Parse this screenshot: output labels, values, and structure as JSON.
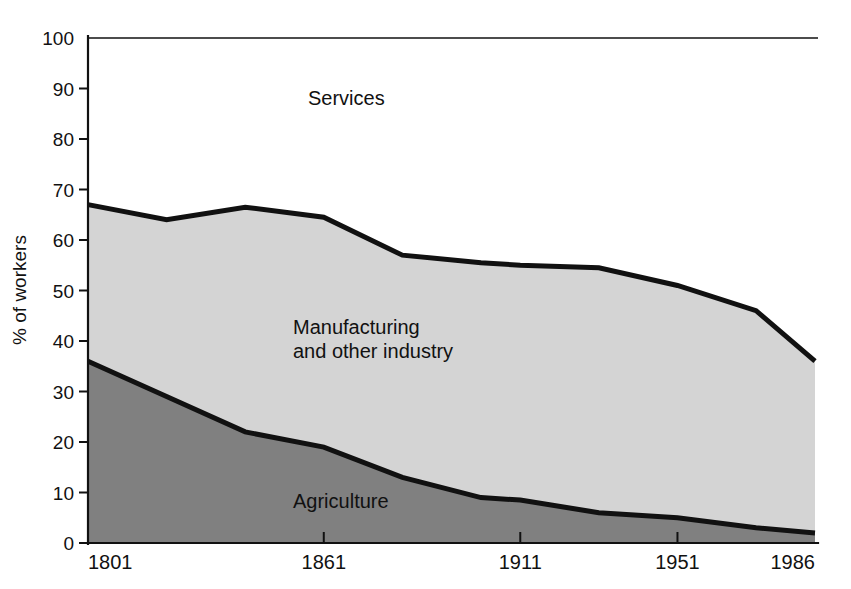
{
  "figure": {
    "background_color": "#ffffff",
    "line_color": "#111111"
  },
  "axes": {
    "y_title": "% of workers",
    "y_ticks": [
      "0",
      "10",
      "20",
      "30",
      "40",
      "50",
      "60",
      "70",
      "80",
      "90",
      "100"
    ],
    "x_ticks": [
      "1801",
      "1861",
      "1911",
      "1951",
      "1986"
    ]
  },
  "labels": {
    "services": "Services",
    "manufacturing_line1": "Manufacturing",
    "manufacturing_line2": "and other industry",
    "agriculture": "Agriculture"
  },
  "chart_data": {
    "type": "area",
    "title": "",
    "subtitle": "",
    "xlabel": "",
    "ylabel": "% of workers",
    "xlim": [
      1801,
      1986
    ],
    "ylim": [
      0,
      100
    ],
    "grid": false,
    "legend_position": "inline-annotations",
    "stacked": true,
    "normalized_to_100": true,
    "x": [
      1801,
      1821,
      1841,
      1861,
      1881,
      1901,
      1911,
      1931,
      1951,
      1971,
      1986
    ],
    "x_tick_values": [
      1801,
      1861,
      1911,
      1951,
      1986
    ],
    "y_tick_values": [
      0,
      10,
      20,
      30,
      40,
      50,
      60,
      70,
      80,
      90,
      100
    ],
    "series": [
      {
        "name": "Agriculture",
        "fill_color": "#808080",
        "values": [
          36,
          29,
          22,
          19,
          13,
          9,
          8.5,
          6,
          5,
          3,
          2
        ]
      },
      {
        "name": "Manufacturing and other industry",
        "fill_color": "#d4d4d4",
        "values": [
          31,
          35,
          44.5,
          45.5,
          44,
          46.5,
          46.5,
          48.5,
          46,
          43,
          34
        ]
      },
      {
        "name": "Services",
        "fill_color": "#ffffff",
        "values": [
          33,
          36,
          33.5,
          35.5,
          43,
          44.5,
          45,
          45.5,
          49,
          54,
          64
        ]
      }
    ],
    "cumulative_boundaries": {
      "agriculture_top": [
        36,
        29,
        22,
        19,
        13,
        9,
        8.5,
        6,
        5,
        3,
        2
      ],
      "manufacturing_top": [
        67,
        64,
        66.5,
        64.5,
        57,
        55.5,
        55,
        54.5,
        51,
        46,
        36
      ]
    },
    "annotations": [
      {
        "text": "Services",
        "x": 1838,
        "y": 88
      },
      {
        "text": "Manufacturing",
        "x": 1840,
        "y": 38
      },
      {
        "text": "and other industry",
        "x": 1840,
        "y": 33
      },
      {
        "text": "Agriculture",
        "x": 1855,
        "y": 10
      }
    ]
  }
}
